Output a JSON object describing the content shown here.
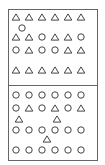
{
  "colors": {
    "stroke": "#444444",
    "border": "#666666",
    "background": "#ffffff"
  },
  "frame": {
    "x": 8,
    "y": 9,
    "width": 89,
    "height": 151,
    "divider_y": 85
  },
  "panels": [
    {
      "name": "top-panel",
      "rows": [
        {
          "y": 17,
          "shapes": [
            "triangle",
            "triangle",
            "triangle",
            "triangle",
            "triangle",
            "triangle"
          ]
        },
        {
          "y": 37,
          "shapes": [
            "triangle",
            "triangle",
            "circle",
            "triangle",
            "triangle",
            "circle"
          ]
        },
        {
          "y": 50,
          "shapes": [
            "circle",
            "triangle",
            "circle",
            "circle",
            "triangle",
            "triangle"
          ]
        },
        {
          "y": 70,
          "shapes": [
            "triangle",
            "triangle",
            "triangle",
            "triangle",
            "triangle",
            "triangle"
          ]
        }
      ],
      "extras": [
        {
          "shape": "circle",
          "x": 22,
          "y": 28
        }
      ]
    },
    {
      "name": "bottom-panel",
      "rows": [
        {
          "y": 95,
          "shapes": [
            "circle",
            "circle",
            "circle",
            "circle",
            "circle",
            "circle"
          ]
        },
        {
          "y": 108,
          "shapes": [
            "circle",
            "triangle",
            "circle",
            "triangle",
            "circle",
            "triangle"
          ]
        },
        {
          "y": 130,
          "shapes": [
            "circle",
            "circle",
            "circle",
            "circle",
            "circle",
            "circle"
          ]
        },
        {
          "y": 150,
          "shapes": [
            "circle",
            "circle",
            "circle",
            "circle",
            "circle",
            "circle"
          ]
        }
      ],
      "extras": [
        {
          "shape": "triangle",
          "x": 19,
          "y": 119
        },
        {
          "shape": "triangle",
          "x": 57,
          "y": 119
        },
        {
          "shape": "triangle",
          "x": 47,
          "y": 139
        }
      ]
    }
  ],
  "column_x": [
    16,
    29,
    42,
    55,
    68,
    81
  ],
  "shape_size": {
    "circle_radius": 3.2,
    "triangle_half_width": 3.8,
    "triangle_height": 6.2
  }
}
